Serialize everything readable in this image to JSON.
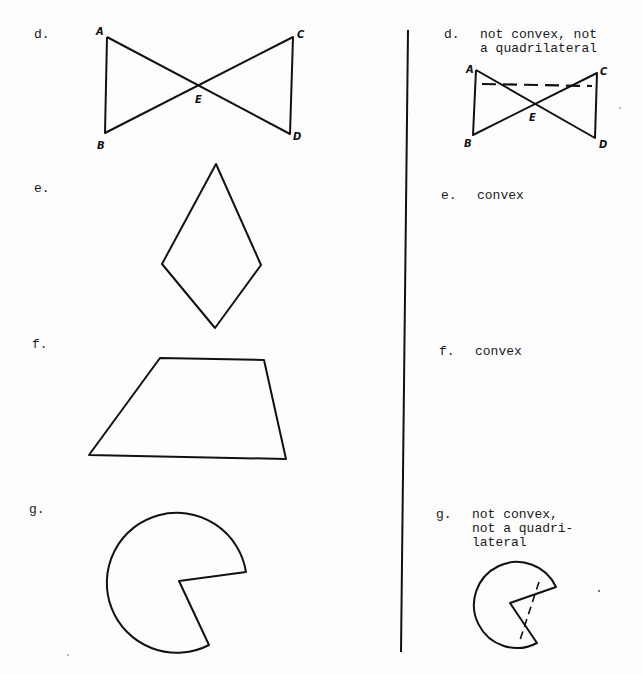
{
  "left_column": {
    "items": [
      {
        "label": "d.",
        "figure": "bowtie",
        "points": [
          "A",
          "B",
          "C",
          "D",
          "E"
        ]
      },
      {
        "label": "e.",
        "figure": "kite"
      },
      {
        "label": "f.",
        "figure": "trapezoid"
      },
      {
        "label": "g.",
        "figure": "pacman-circle-sector"
      }
    ]
  },
  "right_column": {
    "items": [
      {
        "label": "d.",
        "answer_line1": "not convex, not",
        "answer_line2": "a quadrilateral",
        "figure": "bowtie-with-dashed-segment",
        "points": [
          "A",
          "B",
          "C",
          "D",
          "E"
        ]
      },
      {
        "label": "e.",
        "answer_line1": "convex"
      },
      {
        "label": "f.",
        "answer_line1": "convex"
      },
      {
        "label": "g.",
        "answer_line1": "not convex,",
        "answer_line2": "not a quadri-",
        "answer_line3": "lateral",
        "figure": "pacman-with-dashed-segment"
      }
    ]
  },
  "colors": {
    "ink": "#111111",
    "paper": "#fdfdfd"
  }
}
